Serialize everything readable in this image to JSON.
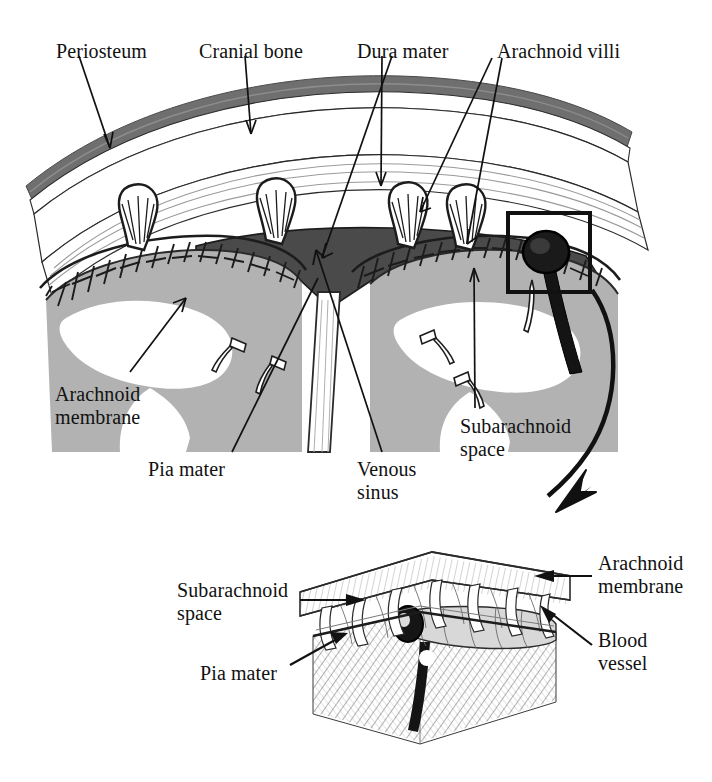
{
  "figure": {
    "background": "#ffffff",
    "ink": "#111111"
  },
  "colors": {
    "ink": "#111111",
    "periosteum": "#6f6f6f",
    "bone_fill": "#ffffff",
    "trabecula_line": "#2a2a2a",
    "venous_sinus": "#4a4a4a",
    "brain_gray": "#b2b2b2",
    "white_matter": "#ffffff",
    "hatch": "#4a4a4a",
    "vessel_dark": "#141414"
  },
  "main_diagram": {
    "labels": [
      {
        "id": "periosteum",
        "text": "Periosteum",
        "x": 56,
        "y": 40
      },
      {
        "id": "cranial-bone",
        "text": "Cranial bone",
        "x": 199,
        "y": 40
      },
      {
        "id": "dura-mater",
        "text": "Dura mater",
        "x": 357,
        "y": 40
      },
      {
        "id": "arachnoid-villi",
        "text": "Arachnoid villi",
        "x": 497,
        "y": 40
      },
      {
        "id": "arachnoid-membrane",
        "text": "Arachnoid\nmembrane",
        "x": 55,
        "y": 383
      },
      {
        "id": "pia-mater",
        "text": "Pia mater",
        "x": 148,
        "y": 458
      },
      {
        "id": "venous-sinus",
        "text": "Venous\nsinus",
        "x": 357,
        "y": 458
      },
      {
        "id": "subarachnoid-space",
        "text": "Subarachnoid\nspace",
        "x": 460,
        "y": 415
      }
    ]
  },
  "inset_diagram": {
    "labels": [
      {
        "id": "subarachnoid-space-inset",
        "text": "Subarachnoid\nspace",
        "x": 177,
        "y": 579
      },
      {
        "id": "pia-mater-inset",
        "text": "Pia mater",
        "x": 200,
        "y": 662
      },
      {
        "id": "arachnoid-membrane-inset",
        "text": "Arachnoid\nmembrane",
        "x": 598,
        "y": 552
      },
      {
        "id": "blood-vessel-inset",
        "text": "Blood\nvessel",
        "x": 598,
        "y": 629
      }
    ]
  }
}
